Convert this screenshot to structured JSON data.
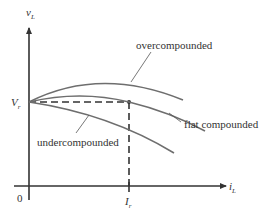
{
  "diagram": {
    "type": "dc-generator-terminal-characteristics",
    "axes": {
      "y_label": "v",
      "y_label_sub": "L",
      "x_label": "i",
      "x_label_sub": "L",
      "origin_label": "0"
    },
    "markers": {
      "rated_voltage_label": "V",
      "rated_voltage_sub": "r",
      "rated_current_label": "I",
      "rated_current_sub": "r"
    },
    "curves": [
      {
        "name": "overcompounded",
        "label": "overcompounded",
        "color": "#6e6e6e"
      },
      {
        "name": "flat compounded",
        "label": "flat compounded",
        "color": "#6e6e6e"
      },
      {
        "name": "undercompounded",
        "label": "undercompounded",
        "color": "#6e6e6e"
      }
    ],
    "colors": {
      "axis": "#333333",
      "curve": "#6e6e6e",
      "text": "#333333"
    }
  }
}
